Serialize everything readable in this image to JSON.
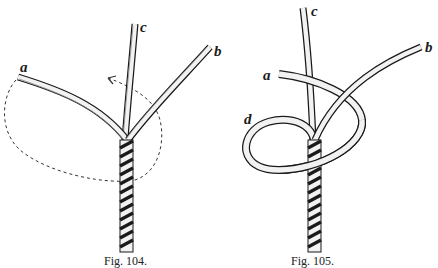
{
  "figures": [
    {
      "id": "fig-104",
      "caption": "Fig. 104.",
      "labels": {
        "a": "a",
        "b": "b",
        "c": "c"
      },
      "description": "Three rope strands a, b, c emerging from a twisted rope, with a dashed arrow showing strand a to be looped around clockwise"
    },
    {
      "id": "fig-105",
      "caption": "Fig. 105.",
      "labels": {
        "a": "a",
        "b": "b",
        "c": "c",
        "d": "d"
      },
      "description": "Strand a looped around forming loop d, crossing over strand c and under strand b"
    }
  ],
  "colors": {
    "ink": "#1a1a1a",
    "paper": "#ffffff",
    "rope_fill": "#f2f2f2"
  }
}
